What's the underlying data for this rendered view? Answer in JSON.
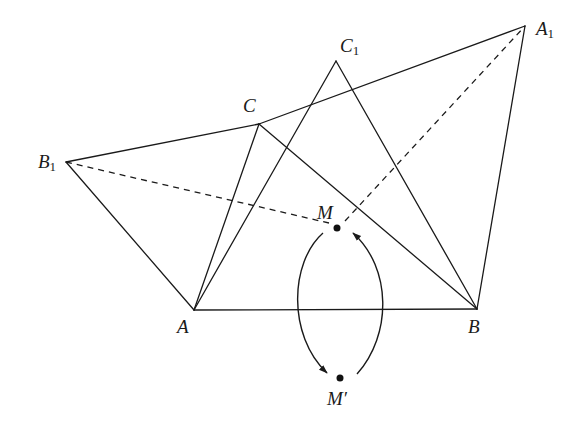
{
  "diagram": {
    "title": "",
    "colors": {
      "stroke": "#1a1a1a",
      "background": "#ffffff"
    },
    "points": {
      "A": {
        "label": "A",
        "sub": "",
        "x": 194,
        "y": 310
      },
      "B": {
        "label": "B",
        "sub": "",
        "x": 477,
        "y": 309
      },
      "C": {
        "label": "C",
        "sub": "",
        "x": 259,
        "y": 124
      },
      "C1": {
        "label": "C",
        "sub": "1",
        "x": 336,
        "y": 61
      },
      "A1": {
        "label": "A",
        "sub": "1",
        "x": 525,
        "y": 26
      },
      "B1": {
        "label": "B",
        "sub": "1",
        "x": 66,
        "y": 162
      },
      "M": {
        "label": "M",
        "sub": "",
        "x": 337,
        "y": 228
      },
      "Mp": {
        "label": "M′",
        "sub": "",
        "x": 340,
        "y": 378
      }
    },
    "solid_segments": [
      [
        "A",
        "B"
      ],
      [
        "A",
        "C"
      ],
      [
        "C",
        "B"
      ],
      [
        "A",
        "C1"
      ],
      [
        "C1",
        "B"
      ],
      [
        "B1",
        "C"
      ],
      [
        "C",
        "A1"
      ],
      [
        "B1",
        "A"
      ],
      [
        "A1",
        "B"
      ]
    ],
    "dashed_segments": [
      [
        "B1",
        "M"
      ],
      [
        "M",
        "A1"
      ]
    ],
    "arrows": [
      {
        "from": "M",
        "to": "M′",
        "side": "left"
      },
      {
        "from": "M′",
        "to": "M",
        "side": "right"
      }
    ]
  }
}
